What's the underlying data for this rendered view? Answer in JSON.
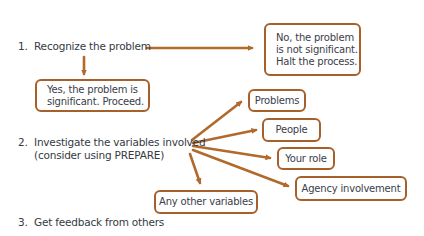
{
  "colors": {
    "arrow": "#b06a2c",
    "box_border": "#a8602a",
    "text": "#353a44"
  },
  "steps": [
    {
      "number": "1.",
      "text": "Recognize the problem"
    },
    {
      "number": "2.",
      "text": "Investigate the variables involved",
      "subtext": "(consider using PREPARE)"
    },
    {
      "number": "3.",
      "text": "Get feedback from others"
    }
  ],
  "outcomes": {
    "no": {
      "lines": [
        "No, the problem",
        "is not significant.",
        "Halt the process."
      ]
    },
    "yes": {
      "lines": [
        "Yes, the problem is",
        "significant. Proceed."
      ]
    }
  },
  "variables": [
    {
      "label": "Problems"
    },
    {
      "label": "People"
    },
    {
      "label": "Your role"
    },
    {
      "label": "Agency involvement"
    },
    {
      "label": "Any other variables"
    }
  ]
}
